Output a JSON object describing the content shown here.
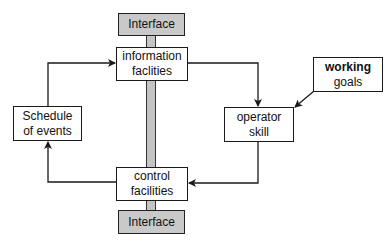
{
  "diagram": {
    "nodes": {
      "interface_top": {
        "label": "Interface"
      },
      "information_facilities": {
        "line1": "information",
        "line2": "faclities"
      },
      "schedule_of_events": {
        "line1": "Schedule",
        "line2": "of events"
      },
      "operator_skill": {
        "line1": "operator",
        "line2": "skill"
      },
      "working_goals": {
        "line1": "working",
        "line2": "goals"
      },
      "control_facilities": {
        "line1": "control",
        "line2": "facilities"
      },
      "interface_bottom": {
        "label": "Interface"
      }
    },
    "edges": [
      {
        "from": "schedule_of_events",
        "to": "information_facilities"
      },
      {
        "from": "information_facilities",
        "to": "operator_skill"
      },
      {
        "from": "working_goals",
        "to": "operator_skill"
      },
      {
        "from": "operator_skill",
        "to": "control_facilities"
      },
      {
        "from": "control_facilities",
        "to": "schedule_of_events"
      }
    ],
    "colors": {
      "stroke": "#1a1a1a",
      "interface_fill": "#c9c9c9",
      "bar_fill": "#c4c4c4"
    }
  }
}
